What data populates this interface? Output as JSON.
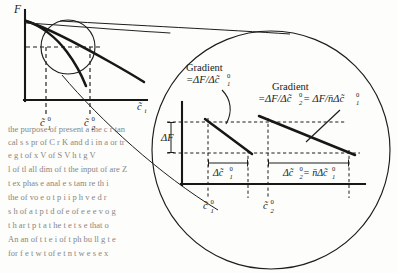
{
  "figure": {
    "name": "gradient-magnifier-diagram",
    "main_plot": {
      "y_axis_label": "F",
      "x_axis_label": "c̃",
      "x_axis_label_sub": "i",
      "tick_labels": [
        {
          "base": "c̃",
          "sub": "1",
          "sup": "0"
        },
        {
          "base": "c̃",
          "sub": "2",
          "sup": "0"
        }
      ]
    },
    "magnified_plot": {
      "annotations": [
        {
          "title": "Gradient",
          "formula": "=ΔF/Δc̃",
          "formula_sub": "1",
          "formula_sup": "0"
        },
        {
          "title": "Gradient",
          "formula_part1": "=ΔF/Δc̃",
          "formula_part1_sub": "2",
          "formula_part1_sup": "0",
          "formula_part2": " = ΔF/n̄Δc̃",
          "formula_part2_sub": "1",
          "formula_part2_sup": "0"
        }
      ],
      "delta_f_label": "ΔF",
      "dimension_labels": [
        {
          "base": "Δc̃",
          "sub": "1",
          "sup": "0"
        },
        {
          "base": "Δc̃",
          "sub": "2",
          "sup": "0",
          "equals": " = n̄Δc̃",
          "equals_sub": "1",
          "equals_sup": "0"
        }
      ],
      "tick_labels": [
        {
          "base": "c̃",
          "sub": "1",
          "sup": "0"
        },
        {
          "base": "c̃",
          "sub": "2",
          "sup": "0"
        }
      ]
    },
    "colors": {
      "ink": "#171715",
      "paper": "#fdfdfb",
      "bleed": "#c9c9c4"
    }
  }
}
